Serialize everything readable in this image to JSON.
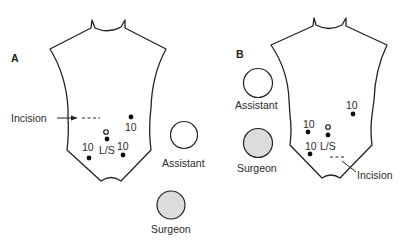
{
  "figure": {
    "panels": [
      {
        "id": "A",
        "label": "A",
        "incision_label": "Incision",
        "ports": [
          {
            "label": "10",
            "type": "port-10mm"
          },
          {
            "label": "L/S",
            "type": "laparoscope"
          },
          {
            "label": "10",
            "type": "port-10mm"
          },
          {
            "label": "10",
            "type": "port-10mm"
          }
        ],
        "assistant_label": "Assistant",
        "surgeon_label": "Surgeon"
      },
      {
        "id": "B",
        "label": "B",
        "incision_label": "Incision",
        "ports": [
          {
            "label": "10",
            "type": "port-10mm"
          },
          {
            "label": "10",
            "type": "port-10mm"
          },
          {
            "label": "L/S",
            "type": "laparoscope"
          },
          {
            "label": "10",
            "type": "port-10mm"
          }
        ],
        "assistant_label": "Assistant",
        "surgeon_label": "Surgeon"
      }
    ],
    "colors": {
      "line": "#222222",
      "surgeon_fill": "#dcdcdc",
      "assistant_fill": "#ffffff",
      "background": "#ffffff"
    }
  }
}
